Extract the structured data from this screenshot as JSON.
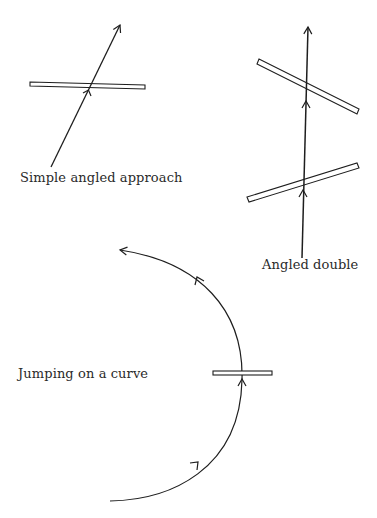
{
  "diagrams": [
    {
      "id": "simple",
      "label": "Simple angled approach",
      "label_pos": {
        "x": 20,
        "y": 170
      },
      "plates": [
        {
          "x1": 30,
          "y1": 84,
          "x2": 145,
          "y2": 87,
          "thickness": 5
        }
      ],
      "path": {
        "type": "line",
        "x1": 51,
        "y1": 167,
        "x2": 120,
        "y2": 25
      },
      "arrowheads": [
        {
          "x": 120,
          "y": 25
        },
        {
          "x": 89,
          "y": 92
        }
      ]
    },
    {
      "id": "double",
      "label": "Angled double",
      "label_pos": {
        "x": 262,
        "y": 257
      },
      "plates": [
        {
          "x1": 258,
          "y1": 62,
          "x2": 358,
          "y2": 112,
          "thickness": 5
        },
        {
          "x1": 248,
          "y1": 199,
          "x2": 358,
          "y2": 166,
          "thickness": 5
        }
      ],
      "path": {
        "type": "line",
        "x1": 302,
        "y1": 258,
        "x2": 308,
        "y2": 27
      },
      "arrowheads": [
        {
          "x": 308,
          "y": 27
        },
        {
          "x": 306,
          "y": 102
        },
        {
          "x": 303,
          "y": 192
        }
      ]
    },
    {
      "id": "curve",
      "label": "Jumping on a curve",
      "label_pos": {
        "x": 18,
        "y": 366
      },
      "plates": [
        {
          "x1": 213,
          "y1": 371,
          "x2": 272,
          "y2": 371,
          "thickness": 5
        }
      ],
      "path": {
        "type": "arc"
      },
      "arrowheads": [
        {
          "x": 118,
          "y": 250
        },
        {
          "x": 197,
          "y": 278
        },
        {
          "x": 243,
          "y": 380
        },
        {
          "x": 198,
          "y": 463
        }
      ]
    }
  ],
  "colors": {
    "stroke": "#1e1e1e",
    "background": "#ffffff",
    "text": "#2a2a2a"
  }
}
